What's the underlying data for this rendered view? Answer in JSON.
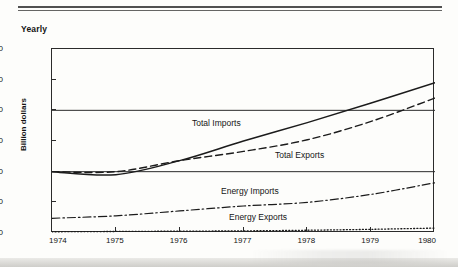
{
  "figure": {
    "frequency_label": "Yearly",
    "ylabel": "Billion dollars"
  },
  "axes": {
    "y_ticks": [
      "0",
      "50",
      "100",
      "150",
      "200",
      "250",
      "300"
    ],
    "x_ticks": [
      "1974",
      "1975",
      "1976",
      "1977",
      "1978",
      "1979",
      "1980"
    ]
  },
  "series_labels": {
    "total_imports": "Total Imports",
    "total_exports": "Total Exports",
    "energy_imports": "Energy Imports",
    "energy_exports": "Energy Exports"
  },
  "chart_data": {
    "type": "line",
    "title": "",
    "subtitle": "Yearly",
    "xlabel": "",
    "ylabel": "Billion dollars",
    "x": [
      1974,
      1975,
      1976,
      1977,
      1978,
      1979,
      1980
    ],
    "xlim": [
      1974,
      1980
    ],
    "ylim": [
      0,
      300
    ],
    "ytick_values": [
      0,
      50,
      100,
      150,
      200,
      250,
      300
    ],
    "grid": "horizontal gridlines at 100 and 200",
    "legend_position": "inline labels on plot",
    "series": [
      {
        "name": "Total Imports",
        "style": "solid",
        "color": "#1b1b1b",
        "values": [
          100,
          95,
          118,
          150,
          180,
          212,
          245
        ]
      },
      {
        "name": "Total Exports",
        "style": "dashed",
        "color": "#1b1b1b",
        "values": [
          100,
          100,
          118,
          133,
          152,
          182,
          220
        ]
      },
      {
        "name": "Energy Imports",
        "style": "dash-dot",
        "color": "#1b1b1b",
        "values": [
          24,
          28,
          36,
          44,
          50,
          63,
          82
        ]
      },
      {
        "name": "Energy Exports",
        "style": "dotted",
        "color": "#1b1b1b",
        "values": [
          2,
          2.5,
          3,
          3.5,
          4.5,
          6,
          8
        ]
      }
    ]
  }
}
